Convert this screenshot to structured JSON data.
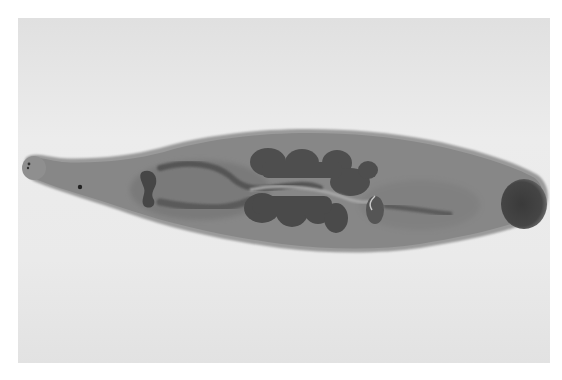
{
  "image": {
    "description": "Grayscale micrograph of a stained flatworm specimen on a light background",
    "subject": "flatworm",
    "orientation": "horizontal, anterior end left, posterior sucker right",
    "colors": {
      "background_light": "#ececec",
      "background_mid": "#dcdcdc",
      "body": "#8a8a8a",
      "body_edge": "#9e9e9e",
      "organs": "#505050",
      "sucker": "#3e3e3e",
      "eyespot": "#222222"
    },
    "features": [
      {
        "name": "oral-end",
        "label": "anterior tip with eyespots"
      },
      {
        "name": "eyespot",
        "label": "dark spot"
      },
      {
        "name": "pharynx",
        "label": "dark anterior organ"
      },
      {
        "name": "lobed-organs-upper",
        "label": "upper lobed organ cluster"
      },
      {
        "name": "lobed-organs-lower",
        "label": "lower lobed organ cluster"
      },
      {
        "name": "posterior-sucker",
        "label": "dark round posterior sucker"
      }
    ]
  }
}
